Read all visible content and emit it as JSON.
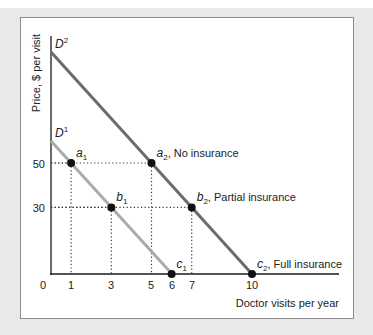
{
  "chart_data": {
    "type": "line",
    "title": "",
    "xlabel": "Doctor visits per year",
    "ylabel": "Price, $ per visit",
    "xlim": [
      0,
      11.3
    ],
    "ylim": [
      0,
      107
    ],
    "x_ticks": [
      "0",
      "1",
      "3",
      "5",
      "6",
      "7",
      "10"
    ],
    "y_ticks": [
      "30",
      "50"
    ],
    "grid": false,
    "series": [
      {
        "name": "D1",
        "label_main": "D",
        "label_sup": "1",
        "color": "#ababab",
        "points": [
          [
            0,
            60
          ],
          [
            6,
            0
          ]
        ]
      },
      {
        "name": "D2",
        "label_main": "D",
        "label_sup": "2",
        "color": "#6b6b6b",
        "points": [
          [
            0,
            100
          ],
          [
            10,
            0
          ]
        ]
      }
    ],
    "marked_points": [
      {
        "id": "a1",
        "main": "a",
        "sub": "1",
        "x": 1,
        "y": 50,
        "annotation": ""
      },
      {
        "id": "b1",
        "main": "b",
        "sub": "1",
        "x": 3,
        "y": 30,
        "annotation": ""
      },
      {
        "id": "c1",
        "main": "c",
        "sub": "1",
        "x": 6,
        "y": 0,
        "annotation": ""
      },
      {
        "id": "a2",
        "main": "a",
        "sub": "2",
        "x": 5,
        "y": 50,
        "annotation": ", No insurance"
      },
      {
        "id": "b2",
        "main": "b",
        "sub": "2",
        "x": 7,
        "y": 30,
        "annotation": ", Partial insurance"
      },
      {
        "id": "c2",
        "main": "c",
        "sub": "2",
        "x": 10,
        "y": 0,
        "annotation": ", Full insurance"
      }
    ],
    "reference_lines": "dotted lines from each point to both axes at price 50 and 30 and quantities 1, 3, 5, 7"
  }
}
